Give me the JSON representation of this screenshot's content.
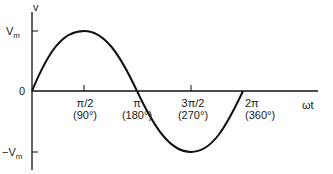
{
  "diagram": {
    "y_axis_label": "v",
    "x_axis_label": "ωt",
    "y_ticks": {
      "positive": {
        "main": "V",
        "sub": "m"
      },
      "zero": "0",
      "negative": {
        "main": "−V",
        "sub": "m"
      }
    },
    "x_ticks": [
      {
        "rad": "π/2",
        "deg": "(90°)"
      },
      {
        "rad": "π",
        "deg": "(180°)"
      },
      {
        "rad": "3π/2",
        "deg": "(270°)"
      },
      {
        "rad": "2π",
        "deg": "(360°)"
      }
    ],
    "curve_color": "#111111"
  }
}
